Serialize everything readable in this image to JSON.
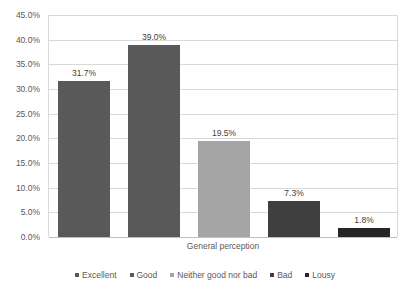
{
  "chart_data": {
    "type": "bar",
    "title": "",
    "subtitle": "",
    "xlabel": "General perception",
    "ylabel": "",
    "categories": [
      "Excellent",
      "Good",
      "Neither good nor bad",
      "Bad",
      "Lousy"
    ],
    "values": [
      31.7,
      39.0,
      19.5,
      7.3,
      1.8
    ],
    "data_labels": [
      "31.7%",
      "39.0%",
      "19.5%",
      "7.3%",
      "1.8%"
    ],
    "bar_colors": [
      "#595959",
      "#595959",
      "#a5a5a5",
      "#3f3f3f",
      "#262626"
    ],
    "ylim": [
      0,
      45
    ],
    "ytick_values": [
      0,
      5,
      10,
      15,
      20,
      25,
      30,
      35,
      40,
      45
    ],
    "ytick_labels": [
      "0.0%",
      "5.0%",
      "10.0%",
      "15.0%",
      "20.0%",
      "25.0%",
      "30.0%",
      "35.0%",
      "40.0%",
      "45.0%"
    ],
    "grid": true,
    "legend_position": "bottom",
    "legend": [
      {
        "label": "Excellent",
        "color": "#595959"
      },
      {
        "label": "Good",
        "color": "#595959"
      },
      {
        "label": "Neither good nor bad",
        "color": "#a5a5a5"
      },
      {
        "label": "Bad",
        "color": "#3f3f3f"
      },
      {
        "label": "Lousy",
        "color": "#262626"
      }
    ],
    "colors": {
      "background": "#ffffff",
      "gridline": "#d9d9d9",
      "axis": "#bfbfbf",
      "text": "#595959",
      "label_text": "#404040"
    }
  }
}
